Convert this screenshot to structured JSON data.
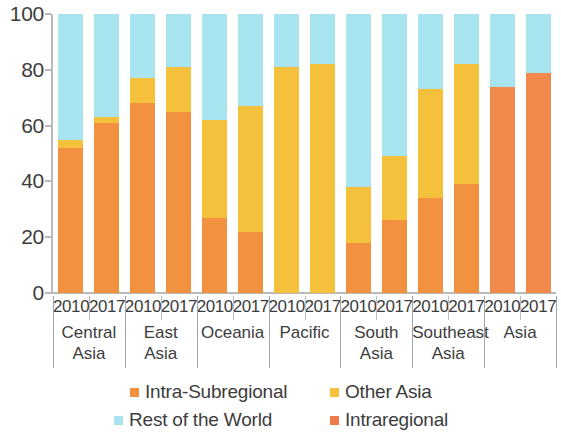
{
  "chart_data": {
    "type": "bar",
    "subtype": "stacked-bar-100-percent",
    "title": "",
    "xlabel": "",
    "ylabel": "",
    "ylim": [
      0,
      100
    ],
    "yticks": [
      0,
      20,
      40,
      60,
      80,
      100
    ],
    "ytick_labels": [
      "0",
      "20",
      "40",
      "60",
      "80",
      "100"
    ],
    "grid": false,
    "legend_position": "bottom",
    "categories": [
      "Central Asia 2010",
      "Central Asia 2017",
      "East Asia 2010",
      "East Asia 2017",
      "Oceania 2010",
      "Oceania 2017",
      "Pacific 2010",
      "Pacific 2017",
      "South Asia 2010",
      "South Asia 2017",
      "Southeast Asia 2010",
      "Southeast Asia 2017",
      "Asia 2010",
      "Asia 2017"
    ],
    "groups": [
      {
        "name": "Central Asia",
        "label_lines": [
          "Central",
          "Asia"
        ],
        "years": [
          "2010",
          "2017"
        ]
      },
      {
        "name": "East Asia",
        "label_lines": [
          "East",
          "Asia"
        ],
        "years": [
          "2010",
          "2017"
        ]
      },
      {
        "name": "Oceania",
        "label_lines": [
          "Oceania"
        ],
        "years": [
          "2010",
          "2017"
        ]
      },
      {
        "name": "Pacific",
        "label_lines": [
          "Pacific"
        ],
        "years": [
          "2010",
          "2017"
        ]
      },
      {
        "name": "South Asia",
        "label_lines": [
          "South",
          "Asia"
        ],
        "years": [
          "2010",
          "2017"
        ]
      },
      {
        "name": "Southeast Asia",
        "label_lines": [
          "Southeast",
          "Asia"
        ],
        "years": [
          "2010",
          "2017"
        ]
      },
      {
        "name": "Asia",
        "label_lines": [
          "Asia"
        ],
        "years": [
          "2010",
          "2017"
        ]
      }
    ],
    "series": [
      {
        "name": "Intra-Subregional",
        "color": "#F2913F",
        "values": [
          52,
          61,
          68,
          65,
          27,
          22,
          0,
          0,
          18,
          26,
          34,
          39,
          null,
          null
        ]
      },
      {
        "name": "Intraregional",
        "color": "#F0894A",
        "values": [
          null,
          null,
          null,
          null,
          null,
          null,
          null,
          null,
          null,
          null,
          null,
          null,
          74,
          79
        ]
      },
      {
        "name": "Other Asia",
        "color": "#F5C03C",
        "values": [
          3,
          2,
          9,
          16,
          35,
          45,
          81,
          82,
          20,
          23,
          39,
          43,
          0,
          0
        ]
      },
      {
        "name": "Rest of the World",
        "color": "#A8E4F0",
        "values": [
          45,
          37,
          23,
          19,
          38,
          33,
          19,
          18,
          62,
          51,
          27,
          18,
          26,
          21
        ]
      }
    ],
    "bar_totals": [
      {
        "category": "Central Asia 2010",
        "Intra-Subregional": 52,
        "Other Asia": 3,
        "Rest of the World": 45
      },
      {
        "category": "Central Asia 2017",
        "Intra-Subregional": 61,
        "Other Asia": 2,
        "Rest of the World": 37
      },
      {
        "category": "East Asia 2010",
        "Intra-Subregional": 68,
        "Other Asia": 9,
        "Rest of the World": 23
      },
      {
        "category": "East Asia 2017",
        "Intra-Subregional": 65,
        "Other Asia": 16,
        "Rest of the World": 19
      },
      {
        "category": "Oceania 2010",
        "Intra-Subregional": 27,
        "Other Asia": 35,
        "Rest of the World": 38
      },
      {
        "category": "Oceania 2017",
        "Intra-Subregional": 22,
        "Other Asia": 45,
        "Rest of the World": 33
      },
      {
        "category": "Pacific 2010",
        "Intra-Subregional": 0,
        "Other Asia": 81,
        "Rest of the World": 19
      },
      {
        "category": "Pacific 2017",
        "Intra-Subregional": 0,
        "Other Asia": 82,
        "Rest of the World": 18
      },
      {
        "category": "South Asia 2010",
        "Intra-Subregional": 18,
        "Other Asia": 20,
        "Rest of the World": 62
      },
      {
        "category": "South Asia 2017",
        "Intra-Subregional": 26,
        "Other Asia": 23,
        "Rest of the World": 51
      },
      {
        "category": "Southeast Asia 2010",
        "Intra-Subregional": 34,
        "Other Asia": 39,
        "Rest of the World": 27
      },
      {
        "category": "Southeast Asia 2017",
        "Intra-Subregional": 39,
        "Other Asia": 43,
        "Rest of the World": 18
      },
      {
        "category": "Asia 2010",
        "Intraregional": 74,
        "Rest of the World": 26
      },
      {
        "category": "Asia 2017",
        "Intraregional": 79,
        "Rest of the World": 21
      }
    ]
  },
  "legend": {
    "items": [
      {
        "label": "Intra-Subregional",
        "color": "#F2913F"
      },
      {
        "label": "Other Asia",
        "color": "#F5C03C"
      },
      {
        "label": "Rest of the World",
        "color": "#A8E4F0"
      },
      {
        "label": "Intraregional",
        "color": "#EF7B4A"
      }
    ]
  },
  "axis": {
    "y_tick_labels": [
      "100",
      "80",
      "60",
      "40",
      "20",
      "0"
    ],
    "axis_color": "#b9b9b9"
  }
}
